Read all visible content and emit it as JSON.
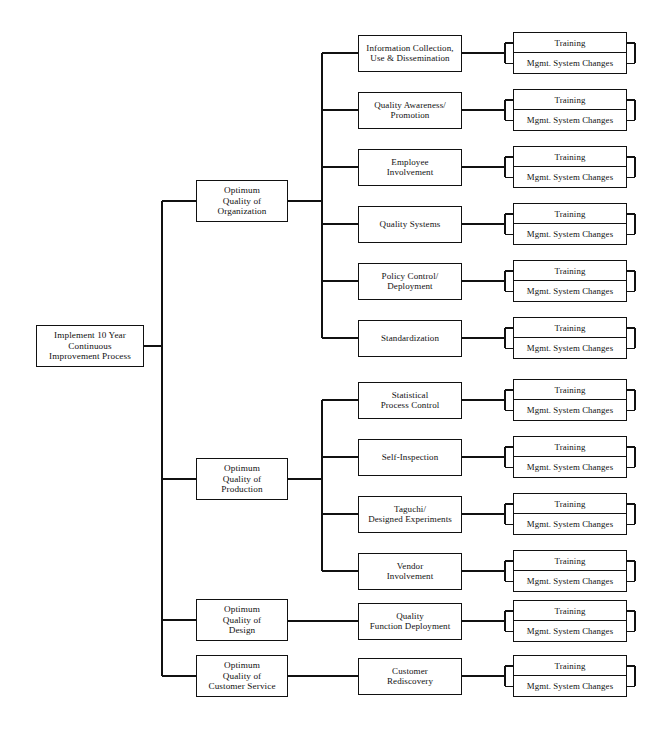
{
  "diagram": {
    "type": "tree",
    "orientation": "left-to-right",
    "line_color": "#111111",
    "box_fill": "#ffffff",
    "root": {
      "label": "Implement 10 Year\nContinuous\nImprovement Process",
      "lines": [
        "Implement 10 Year",
        "Continuous",
        "Improvement Process"
      ]
    },
    "leaf_labels": {
      "training": "Training",
      "mgmt": "Mgmt. System Changes"
    },
    "branches": [
      {
        "id": "organization",
        "lines": [
          "Optimum",
          "Quality of",
          "Organization"
        ],
        "children": [
          {
            "id": "information-collection",
            "lines": [
              "Information Collection,",
              "Use & Dissemination"
            ]
          },
          {
            "id": "quality-awareness",
            "lines": [
              "Quality Awareness/",
              "Promotion"
            ]
          },
          {
            "id": "employee-involvement",
            "lines": [
              "Employee",
              "Involvement"
            ]
          },
          {
            "id": "quality-systems",
            "lines": [
              "Quality Systems"
            ]
          },
          {
            "id": "policy-control",
            "lines": [
              "Policy Control/",
              "Deployment"
            ]
          },
          {
            "id": "standardization",
            "lines": [
              "Standardization"
            ]
          }
        ]
      },
      {
        "id": "production",
        "lines": [
          "Optimum",
          "Quality of",
          "Production"
        ],
        "children": [
          {
            "id": "statistical-process-control",
            "lines": [
              "Statistical",
              "Process Control"
            ]
          },
          {
            "id": "self-inspection",
            "lines": [
              "Self-Inspection"
            ]
          },
          {
            "id": "taguchi",
            "lines": [
              "Taguchi/",
              "Designed Experiments"
            ]
          },
          {
            "id": "vendor-involvement",
            "lines": [
              "Vendor",
              "Involvement"
            ]
          }
        ]
      },
      {
        "id": "design",
        "lines": [
          "Optimum",
          "Quality of",
          "Design"
        ],
        "children": [
          {
            "id": "quality-function-deployment",
            "lines": [
              "Quality",
              "Function Deployment"
            ]
          }
        ]
      },
      {
        "id": "customer-service",
        "lines": [
          "Optimum",
          "Quality of",
          "Customer Service"
        ],
        "children": [
          {
            "id": "customer-rediscovery",
            "lines": [
              "Customer",
              "Rediscovery"
            ]
          }
        ]
      }
    ]
  }
}
